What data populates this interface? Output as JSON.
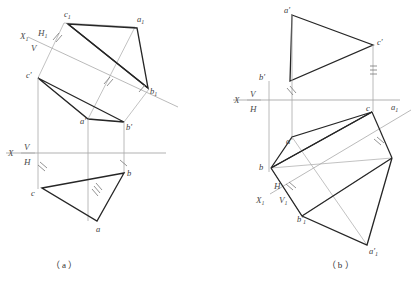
{
  "figure": {
    "title_a": "（ a ）",
    "title_b": "（ b ）",
    "stroke_heavy": "#262626",
    "stroke_light": "#a8a8a8",
    "label_color": "#3a3a3a"
  },
  "diagram_a": {
    "name": "descriptive-geometry-projection-a",
    "labels": {
      "c1": "c",
      "c1_sub": "1",
      "a1": "a",
      "a1_sub": "1",
      "b1": "b",
      "b1_sub": "1",
      "x1": "X",
      "x1_sub": "1",
      "h1": "H",
      "h1_sub": "1",
      "v_aux": "V",
      "c_prime": "c′",
      "a_prime": "a′",
      "b_prime": "b′",
      "x_axis": "X",
      "v": "V",
      "h": "H",
      "c": "c",
      "a": "a",
      "b": "b"
    }
  },
  "diagram_b": {
    "name": "descriptive-geometry-projection-b",
    "labels": {
      "a_prime": "a′",
      "b_prime": "b′",
      "c_prime": "c′",
      "x_axis": "X",
      "v": "V",
      "h": "H",
      "a": "a",
      "b": "b",
      "c": "c",
      "a1": "a",
      "a1_sub": "1",
      "h_aux": "H",
      "x1": "X",
      "x1_sub": "1",
      "v1": "V",
      "v1_sub": "1",
      "b1_prime": "b′",
      "b1_sub": "1",
      "a1_prime": "a′",
      "a1_sub_l": "1"
    }
  }
}
